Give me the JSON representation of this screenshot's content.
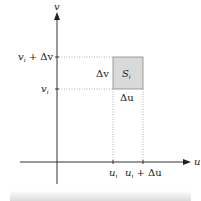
{
  "diagram": {
    "axes": {
      "v_axis_label": "v",
      "u_axis_label": "u"
    },
    "ticks": {
      "v_top": "v",
      "v_top_sub": "i",
      "v_top_suffix": " + Δv",
      "v_bottom": "v",
      "v_bottom_sub": "i",
      "u_left": "u",
      "u_left_sub": "i",
      "u_right": "u",
      "u_right_sub": "i",
      "u_right_suffix": " + Δu"
    },
    "region": {
      "label": "S",
      "label_sub": "i",
      "width_label": "Δu",
      "height_label": "Δv",
      "fill": "#d9d9d9",
      "stroke": "#888888"
    },
    "colors": {
      "axis": "#333333",
      "dotted": "#999999"
    }
  }
}
